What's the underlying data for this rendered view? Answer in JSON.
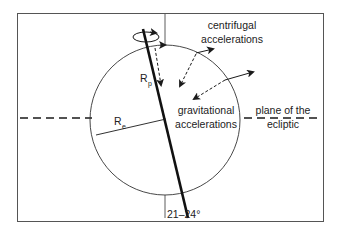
{
  "diagram": {
    "labels": {
      "centrifugal_line1": "centrifugal",
      "centrifugal_line2": "accelerations",
      "gravitational_line1": "gravitational",
      "gravitational_line2": "accelerations",
      "plane_line1": "plane of the",
      "plane_line2": "ecliptic",
      "polar_radius": "R",
      "polar_radius_sub": "p",
      "equatorial_radius": "R",
      "equatorial_radius_sub": "e",
      "tilt_angle": "21–24°"
    },
    "colors": {
      "stroke": "#1a1a1a",
      "frame": "#555555",
      "background": "#ffffff"
    }
  }
}
